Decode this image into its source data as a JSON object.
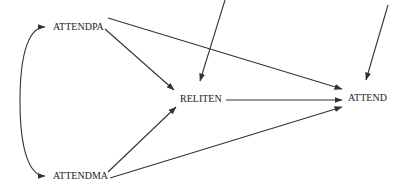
{
  "diagram": {
    "type": "path-diagram",
    "nodes": [
      {
        "id": "attendpa",
        "label": "ATTENDPA",
        "x": 53,
        "y": 21
      },
      {
        "id": "attendma",
        "label": "ATTENDMA",
        "x": 53,
        "y": 170
      },
      {
        "id": "reliten",
        "label": "RELITEN",
        "x": 180,
        "y": 93
      },
      {
        "id": "attend",
        "label": "ATTEND",
        "x": 348,
        "y": 92
      }
    ],
    "edges": [
      {
        "from": "attendpa",
        "to": "reliten",
        "type": "directed"
      },
      {
        "from": "attendpa",
        "to": "attend",
        "type": "directed"
      },
      {
        "from": "attendma",
        "to": "reliten",
        "type": "directed"
      },
      {
        "from": "attendma",
        "to": "attend",
        "type": "directed"
      },
      {
        "from": "reliten",
        "to": "attend",
        "type": "directed"
      },
      {
        "from": "attendpa",
        "to": "attendma",
        "type": "bidirectional-curved"
      },
      {
        "from": "error-reliten",
        "to": "reliten",
        "type": "disturbance"
      },
      {
        "from": "error-attend",
        "to": "attend",
        "type": "disturbance"
      }
    ],
    "colors": {
      "line": "#333333",
      "text": "#222222",
      "background": "#ffffff"
    }
  }
}
